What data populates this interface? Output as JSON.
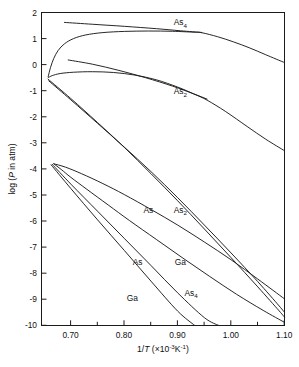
{
  "chart_data": {
    "type": "line",
    "title": "",
    "xlabel": "1/T (×10⁻³K⁻¹)",
    "ylabel": "log (P in atm)",
    "xlim": [
      0.645,
      1.1
    ],
    "ylim": [
      -10,
      2
    ],
    "grid": false,
    "legend_position": "inline-labels",
    "x_ticks": [
      "0.70",
      "0.80",
      "0.90",
      "1.00",
      "1.10"
    ],
    "x_tick_values": [
      0.7,
      0.8,
      0.9,
      1.0,
      1.1
    ],
    "x_minor_ticks": [
      0.75,
      0.85,
      0.95,
      1.05
    ],
    "y_ticks": [
      "2",
      "1",
      "0",
      "-1",
      "-2",
      "-3",
      "-4",
      "-5",
      "-6",
      "-7",
      "-8",
      "-9",
      "-10"
    ],
    "y_tick_values": [
      2,
      1,
      0,
      -1,
      -2,
      -3,
      -4,
      -5,
      -6,
      -7,
      -8,
      -9,
      -10
    ],
    "inline_labels": [
      {
        "text_main": "As",
        "text_sub": "4",
        "x": 0.905,
        "y": 1.52,
        "name": "curve-label-as4-upper"
      },
      {
        "text_main": "As",
        "text_sub": "2",
        "x": 0.905,
        "y": -1.13,
        "name": "curve-label-as2-upper"
      },
      {
        "text_main": "As",
        "text_sub": "",
        "x": 0.845,
        "y": -5.68,
        "name": "curve-label-as-upper"
      },
      {
        "text_main": "As",
        "text_sub": "2",
        "x": 0.905,
        "y": -5.68,
        "name": "curve-label-as2-lower"
      },
      {
        "text_main": "As",
        "text_sub": "",
        "x": 0.825,
        "y": -7.66,
        "name": "curve-label-as-lower"
      },
      {
        "text_main": "Ga",
        "text_sub": "",
        "x": 0.905,
        "y": -7.66,
        "name": "curve-label-ga-upper"
      },
      {
        "text_main": "As",
        "text_sub": "4",
        "x": 0.925,
        "y": -8.86,
        "name": "curve-label-as4-lower"
      },
      {
        "text_main": "Ga",
        "text_sub": "",
        "x": 0.815,
        "y": -9.07,
        "name": "curve-label-ga-lower"
      }
    ],
    "series": [
      {
        "name": "As4-arsenic-rich-branch",
        "comment": "upper near-flat branch starting at left, gentle negative slope",
        "points": [
          [
            0.688,
            1.62
          ],
          [
            0.74,
            1.55
          ],
          [
            0.8,
            1.47
          ],
          [
            0.86,
            1.38
          ],
          [
            0.905,
            1.3
          ],
          [
            0.945,
            1.235
          ]
        ]
      },
      {
        "name": "As4-gallium-rich-branch",
        "comment": "lower lobe of As4: rises from three-phase point, peaks, then falls steeply",
        "points": [
          [
            0.6575,
            -0.46
          ],
          [
            0.662,
            -0.1
          ],
          [
            0.668,
            0.24
          ],
          [
            0.676,
            0.54
          ],
          [
            0.688,
            0.8
          ],
          [
            0.705,
            1.0
          ],
          [
            0.728,
            1.14
          ],
          [
            0.76,
            1.23
          ],
          [
            0.8,
            1.275
          ],
          [
            0.845,
            1.29
          ],
          [
            0.89,
            1.28
          ],
          [
            0.93,
            1.245
          ],
          [
            0.945,
            1.225
          ],
          [
            0.975,
            1.07
          ],
          [
            1.005,
            0.87
          ],
          [
            1.035,
            0.64
          ],
          [
            1.065,
            0.38
          ],
          [
            1.1,
            0.08
          ]
        ]
      },
      {
        "name": "As2-arsenic-rich-branch",
        "comment": "upper straight-ish line from 0.072 at x=0.695 descending",
        "points": [
          [
            0.695,
            0.18
          ],
          [
            0.74,
            0.02
          ],
          [
            0.79,
            -0.22
          ],
          [
            0.84,
            -0.5
          ],
          [
            0.89,
            -0.82
          ],
          [
            0.93,
            -1.12
          ],
          [
            0.955,
            -1.32
          ]
        ]
      },
      {
        "name": "As2-gallium-rich-branch",
        "comment": "lower As2 lobe from three-phase point, peaks near -0.27, then falls",
        "points": [
          [
            0.6575,
            -0.5
          ],
          [
            0.665,
            -0.42
          ],
          [
            0.68,
            -0.34
          ],
          [
            0.705,
            -0.29
          ],
          [
            0.74,
            -0.27
          ],
          [
            0.78,
            -0.3
          ],
          [
            0.82,
            -0.4
          ],
          [
            0.86,
            -0.58
          ],
          [
            0.9,
            -0.86
          ],
          [
            0.93,
            -1.12
          ],
          [
            0.955,
            -1.36
          ],
          [
            0.99,
            -1.8
          ],
          [
            1.03,
            -2.37
          ],
          [
            1.065,
            -2.86
          ],
          [
            1.1,
            -3.3
          ]
        ]
      },
      {
        "name": "As-monomer-arsenic-rich",
        "comment": "steep line from three-phase point down to lower right",
        "points": [
          [
            0.6585,
            -0.62
          ],
          [
            0.7,
            -1.35
          ],
          [
            0.75,
            -2.25
          ],
          [
            0.8,
            -3.16
          ],
          [
            0.85,
            -4.1
          ],
          [
            0.9,
            -5.1
          ],
          [
            0.95,
            -6.15
          ],
          [
            1.0,
            -7.22
          ],
          [
            1.05,
            -8.32
          ],
          [
            1.09,
            -9.25
          ],
          [
            1.1,
            -9.5
          ]
        ]
      },
      {
        "name": "As2-gallium-rich-steep",
        "comment": "steep line just left/below the As monomer line",
        "points": [
          [
            0.6575,
            -0.56
          ],
          [
            0.7,
            -1.3
          ],
          [
            0.75,
            -2.22
          ],
          [
            0.8,
            -3.17
          ],
          [
            0.85,
            -4.18
          ],
          [
            0.9,
            -5.22
          ],
          [
            0.95,
            -6.3
          ],
          [
            1.0,
            -7.4
          ],
          [
            1.05,
            -8.52
          ],
          [
            1.09,
            -9.44
          ],
          [
            1.1,
            -9.68
          ]
        ]
      },
      {
        "name": "Ga-upper-loop-branch",
        "comment": "upper edge of narrow lower loop, from vertex at (0.668,-3.80) descending right",
        "points": [
          [
            0.668,
            -3.8
          ],
          [
            0.69,
            -3.93
          ],
          [
            0.72,
            -4.18
          ],
          [
            0.76,
            -4.56
          ],
          [
            0.8,
            -4.98
          ],
          [
            0.85,
            -5.55
          ],
          [
            0.9,
            -6.15
          ],
          [
            0.95,
            -6.8
          ],
          [
            1.0,
            -7.48
          ],
          [
            1.05,
            -8.22
          ],
          [
            1.1,
            -8.98
          ]
        ]
      },
      {
        "name": "Ga-lower-loop-branch",
        "comment": "lower edge of narrow lower loop closing back at vertex",
        "points": [
          [
            0.668,
            -3.8
          ],
          [
            0.682,
            -4.02
          ],
          [
            0.7,
            -4.32
          ],
          [
            0.73,
            -4.78
          ],
          [
            0.77,
            -5.38
          ],
          [
            0.81,
            -5.98
          ],
          [
            0.86,
            -6.7
          ],
          [
            0.91,
            -7.42
          ],
          [
            0.96,
            -8.12
          ],
          [
            1.01,
            -8.8
          ],
          [
            1.06,
            -9.42
          ],
          [
            1.1,
            -9.88
          ]
        ]
      },
      {
        "name": "As4-lower-steep-line",
        "comment": "steepest line in lower region reaching bottom axis near x=0.985",
        "points": [
          [
            0.665,
            -3.82
          ],
          [
            0.7,
            -4.58
          ],
          [
            0.75,
            -5.62
          ],
          [
            0.8,
            -6.66
          ],
          [
            0.85,
            -7.7
          ],
          [
            0.9,
            -8.75
          ],
          [
            0.95,
            -9.7
          ],
          [
            0.977,
            -10.0
          ]
        ]
      },
      {
        "name": "Ga-lowest-steep-line",
        "comment": "second steepest line reaching bottom axis near x=0.955",
        "points": [
          [
            0.663,
            -3.84
          ],
          [
            0.7,
            -4.75
          ],
          [
            0.75,
            -5.95
          ],
          [
            0.8,
            -7.12
          ],
          [
            0.85,
            -8.3
          ],
          [
            0.9,
            -9.45
          ],
          [
            0.932,
            -10.0
          ]
        ]
      }
    ]
  },
  "figure": {
    "axis_x_label": "1/T (×10⁻³K⁻¹)",
    "axis_x_label_parts": {
      "frac": "1/",
      "ital": "T",
      "open": " (×10",
      "exp1": "-3",
      "mid": "K",
      "exp2": "-1",
      "close": ")"
    },
    "axis_y_label_parts": {
      "pre": "log (",
      "ital": "P",
      "post": " in atm)"
    }
  }
}
